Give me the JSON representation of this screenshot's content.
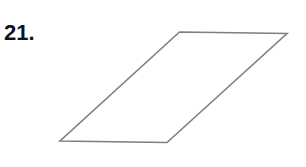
{
  "problem": {
    "number_label": "21."
  },
  "figure": {
    "shape": "parallelogram",
    "stroke_color": "#7f7f7f",
    "fill_color": "none",
    "stroke_width": 1.6,
    "vertices": [
      {
        "name": "top-left",
        "x": 179.5,
        "y": 32
      },
      {
        "name": "top-right",
        "x": 287,
        "y": 33.5
      },
      {
        "name": "bottom-right",
        "x": 167,
        "y": 142.5
      },
      {
        "name": "bottom-left",
        "x": 60,
        "y": 141
      }
    ]
  }
}
